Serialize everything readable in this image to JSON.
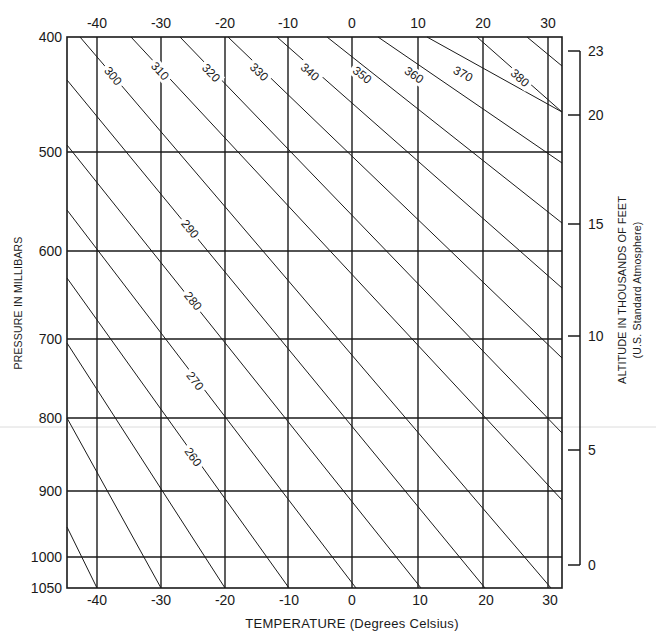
{
  "chart_data": {
    "type": "line",
    "title": "",
    "xlabel": "TEMPERATURE",
    "xlabel_units": "(Degrees Celsius)",
    "ylabel": "PRESSURE IN MILLIBARS",
    "y2label": "ALTITUDE IN THOUSANDS OF FEET",
    "y2label_sub": "(U.S. Standard Atmosphere)",
    "xlim": [
      -45,
      32
    ],
    "ylim": [
      1050,
      400
    ],
    "grid": true,
    "temperature_ticks": [
      -40,
      -30,
      -20,
      -10,
      0,
      10,
      20,
      30
    ],
    "pressure_ticks": [
      400,
      500,
      600,
      700,
      800,
      900,
      1000,
      1050
    ],
    "altitude_ticks": [
      23,
      20,
      15,
      10,
      5,
      0
    ],
    "dry_adiabats_potential_temperature_K": [
      230,
      240,
      250,
      260,
      270,
      280,
      290,
      300,
      310,
      320,
      330,
      340,
      350,
      360,
      370,
      380,
      390
    ],
    "labeled_adiabats_K": [
      260,
      270,
      280,
      290,
      300,
      310,
      320,
      330,
      340,
      350,
      360,
      370,
      380
    ]
  },
  "layout": {
    "plot": {
      "left": 67,
      "right": 562,
      "top": 37,
      "bottom": 588
    },
    "temp_x": {
      "-40": 97,
      "-30": 161,
      "-20": 225,
      "-10": 288,
      "0": 352,
      "10": 418,
      "20": 483,
      "30": 548
    },
    "bottom_temp_label_x": {
      "-40": 97,
      "-30": 161,
      "-20": 225,
      "-10": 289,
      "0": 352,
      "10": 420,
      "20": 486,
      "30": 550
    },
    "pressure_y": {
      "400": 37,
      "500": 152,
      "600": 251,
      "700": 339,
      "800": 418,
      "900": 491,
      "1000": 557,
      "1050": 588
    },
    "altitude_axis_x": 568,
    "altitude_y": {
      "23": 51,
      "20": 115,
      "15": 224,
      "10": 336,
      "5": 450,
      "0": 565
    },
    "adiabats": [
      {
        "k": 230,
        "x1": 67,
        "y1": 527,
        "x2": 97,
        "y2": 588
      },
      {
        "k": 240,
        "x1": 67,
        "y1": 418,
        "x2": 161,
        "y2": 588
      },
      {
        "k": 250,
        "x1": 67,
        "y1": 343,
        "x2": 225,
        "y2": 588
      },
      {
        "k": 260,
        "x1": 67,
        "y1": 278,
        "x2": 289,
        "y2": 588,
        "lx": 193,
        "ly": 457
      },
      {
        "k": 270,
        "x1": 67,
        "y1": 210,
        "x2": 356,
        "y2": 588,
        "lx": 195,
        "ly": 381
      },
      {
        "k": 280,
        "x1": 67,
        "y1": 145,
        "x2": 421,
        "y2": 588,
        "lx": 193,
        "ly": 301
      },
      {
        "k": 290,
        "x1": 67,
        "y1": 80,
        "x2": 485,
        "y2": 588,
        "lx": 190,
        "ly": 229
      },
      {
        "k": 300,
        "x1": 80,
        "y1": 37,
        "x2": 551,
        "y2": 588,
        "lx": 113,
        "ly": 76
      },
      {
        "k": 310,
        "x1": 131,
        "y1": 37,
        "x2": 562,
        "y2": 500,
        "lx": 160,
        "ly": 71
      },
      {
        "k": 320,
        "x1": 180,
        "y1": 37,
        "x2": 562,
        "y2": 433,
        "lx": 211,
        "ly": 73
      },
      {
        "k": 330,
        "x1": 228,
        "y1": 37,
        "x2": 562,
        "y2": 358,
        "lx": 259,
        "ly": 72
      },
      {
        "k": 340,
        "x1": 277,
        "y1": 37,
        "x2": 562,
        "y2": 288,
        "lx": 310,
        "ly": 72
      },
      {
        "k": 350,
        "x1": 327,
        "y1": 37,
        "x2": 562,
        "y2": 223,
        "lx": 362,
        "ly": 75
      },
      {
        "k": 360,
        "x1": 378,
        "y1": 37,
        "x2": 562,
        "y2": 163,
        "lx": 414,
        "ly": 75
      },
      {
        "k": 370,
        "x1": 427,
        "y1": 37,
        "x2": 562,
        "y2": 112,
        "lx": 463,
        "ly": 74
      },
      {
        "k": 380,
        "x1": 477,
        "y1": 37,
        "x2": 562,
        "y2": 112,
        "lx": 520,
        "ly": 78
      },
      {
        "k": 390,
        "x1": 527,
        "y1": 37,
        "x2": 562,
        "y2": 66
      }
    ]
  },
  "colors": {
    "ink": "#1a1a1a",
    "background": "#ffffff",
    "scan_artifact": "#d8d8d8"
  }
}
